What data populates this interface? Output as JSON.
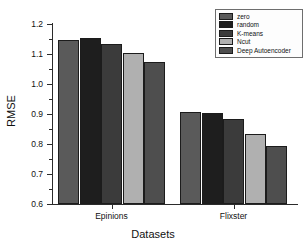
{
  "chart_data": {
    "type": "bar",
    "title": "",
    "xlabel": "Datasets",
    "ylabel": "RMSE",
    "categories": [
      "Epinions",
      "Flixster"
    ],
    "ylim": [
      0.6,
      1.2
    ],
    "yticks": [
      "0.6",
      "0.7",
      "0.8",
      "0.9",
      "1.0",
      "1.1",
      "1.2"
    ],
    "grid": false,
    "legend_position": "top-right",
    "series": [
      {
        "name": "zero",
        "color": "#5a5a5a",
        "values": [
          1.147,
          0.907
        ]
      },
      {
        "name": "random",
        "color": "#1e1e1e",
        "values": [
          1.155,
          0.903
        ]
      },
      {
        "name": "K-means",
        "color": "#3b3b3b",
        "values": [
          1.133,
          0.884
        ]
      },
      {
        "name": "Ncut",
        "color": "#b0b0b0",
        "values": [
          1.104,
          0.835
        ]
      },
      {
        "name": "Deep Autoencoder",
        "color": "#4e4e4e",
        "values": [
          1.073,
          0.792
        ]
      }
    ]
  },
  "axes": {
    "y_title": "RMSE",
    "x_title": "Datasets"
  },
  "legend": {
    "items": [
      {
        "label": "zero"
      },
      {
        "label": "random"
      },
      {
        "label": "K-means"
      },
      {
        "label": "Ncut"
      },
      {
        "label": "Deep Autoencoder"
      }
    ]
  }
}
